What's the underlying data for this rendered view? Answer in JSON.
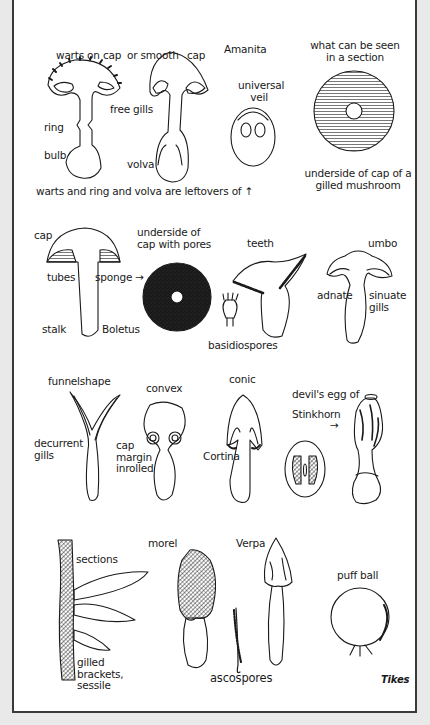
{
  "colors": {
    "background": "#e9e9e9",
    "sheet": "#ffffff",
    "border": "#3a3a3a",
    "ink": "#1a1a1a"
  },
  "section1": {
    "amanita_warted": {
      "warts_on_cap": "warts on cap",
      "ring": "ring",
      "bulb": "bulb"
    },
    "amanita_smooth": {
      "or_smooth": "or smooth",
      "cap": "cap",
      "free_gills": "free gills",
      "volva": "volva"
    },
    "amanita_title": "Amanita",
    "universal_veil": "universal veil",
    "leftovers_note": "warts and ring   and  volva are leftovers of ↑",
    "gill_section": {
      "heading": "what can be seen in a section",
      "caption": "underside of cap of a gilled mushroom"
    }
  },
  "section2": {
    "boletus": {
      "cap": "cap",
      "tubes": "tubes",
      "sponge": "sponge →",
      "stalk": "stalk",
      "name": "Boletus"
    },
    "pores": "underside of cap with pores",
    "teeth": "teeth",
    "basidiospores": "basidiospores",
    "umbo_group": {
      "umbo": "umbo",
      "adnate": "adnate",
      "sinuate_gills": "sinuate gills"
    }
  },
  "section3": {
    "funnelshape": "funnelshape",
    "decurrent_gills": "decurrent gills",
    "convex": "convex",
    "cap_margin_inrolled": "cap margin inrolled",
    "conic": "conic",
    "cortina": "Cortina",
    "stinkhorn": "devil's egg of Stinkhorn",
    "arrow": "→"
  },
  "section4": {
    "sections": "sections",
    "gilled_brackets": "gilled brackets, sessile",
    "morel": "morel",
    "verpa": "Verpa",
    "ascospores": "ascospores",
    "puffball": "puff ball",
    "signature": "Tikes"
  }
}
